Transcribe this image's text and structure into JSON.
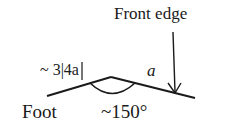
{
  "diagram": {
    "labels": {
      "front_edge": "Front edge",
      "ratio": "~ 3|4a",
      "a": "a",
      "foot": "Foot",
      "angle": "~150°"
    },
    "colors": {
      "stroke": "#1a1a1a",
      "background": "#ffffff"
    }
  }
}
